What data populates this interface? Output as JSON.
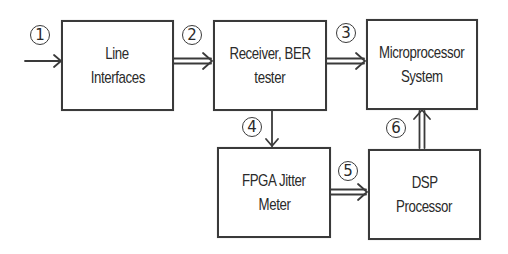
{
  "diagram": {
    "type": "block-diagram",
    "colors": {
      "stroke": "#3a3a3a",
      "text": "#2a2a2a",
      "background": "#ffffff"
    },
    "blocks": [
      {
        "id": "line_interfaces",
        "lines": [
          "Line",
          "Interfaces"
        ]
      },
      {
        "id": "receiver_ber",
        "lines": [
          "Receiver, BER",
          "tester"
        ]
      },
      {
        "id": "microprocessor",
        "lines": [
          "Microprocessor",
          "System"
        ]
      },
      {
        "id": "fpga_jitter",
        "lines": [
          "FPGA Jitter",
          "Meter"
        ]
      },
      {
        "id": "dsp",
        "lines": [
          "DSP",
          "Processor"
        ]
      }
    ],
    "badges": [
      "1",
      "2",
      "3",
      "4",
      "5",
      "6"
    ],
    "connections": [
      {
        "label": "1",
        "from": "input",
        "to": "line_interfaces",
        "style": "single-arrow"
      },
      {
        "label": "2",
        "from": "line_interfaces",
        "to": "receiver_ber",
        "style": "double-arrow"
      },
      {
        "label": "3",
        "from": "receiver_ber",
        "to": "microprocessor",
        "style": "double-arrow"
      },
      {
        "label": "4",
        "from": "receiver_ber",
        "to": "fpga_jitter",
        "style": "single-arrow"
      },
      {
        "label": "5",
        "from": "fpga_jitter",
        "to": "dsp",
        "style": "double-arrow"
      },
      {
        "label": "6",
        "from": "dsp",
        "to": "microprocessor",
        "style": "double-arrow"
      }
    ]
  }
}
